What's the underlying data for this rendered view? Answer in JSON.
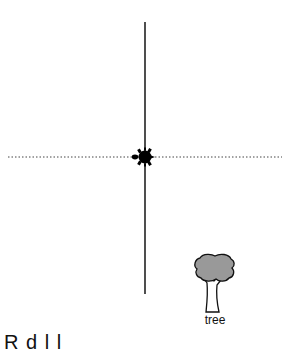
{
  "scene": {
    "background": "#ffffff",
    "vertical_axis": {
      "x": 145,
      "y1": 22,
      "y2": 294,
      "color": "#222222",
      "style": "solid"
    },
    "horizontal_axis": {
      "y": 157,
      "x1": 8,
      "x2": 282,
      "color": "#444444",
      "style": "dotted"
    },
    "turtle": {
      "x": 144,
      "y": 157,
      "heading": "left",
      "color": "#000000"
    },
    "tree": {
      "label": "tree",
      "canopy_color": "#999999",
      "outline_color": "#111111"
    }
  },
  "footer": {
    "clipped_text": "R     d                   l  l"
  }
}
